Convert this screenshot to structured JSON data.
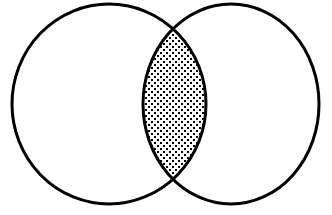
{
  "diagram": {
    "type": "venn",
    "sets": [
      {
        "id": "A",
        "shape": {
          "cx": 109,
          "cy": 104,
          "rx": 97,
          "ry": 100
        }
      },
      {
        "id": "B",
        "shape": {
          "cx": 231,
          "cy": 104,
          "rx": 88,
          "ry": 100
        }
      }
    ],
    "highlighted_region": "A∩B",
    "fill_pattern": "dotted",
    "colors": {
      "background": "#ffffff",
      "stroke": "#000000",
      "dot": "#000000"
    },
    "stroke_width": 3
  }
}
